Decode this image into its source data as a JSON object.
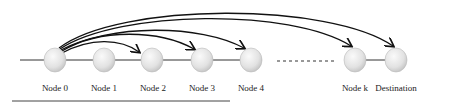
{
  "diagram": {
    "nodes": [
      {
        "id": "n0",
        "label": "Node 0"
      },
      {
        "id": "n1",
        "label": "Node 1"
      },
      {
        "id": "n2",
        "label": "Node 2"
      },
      {
        "id": "n3",
        "label": "Node 3"
      },
      {
        "id": "n4",
        "label": "Node 4"
      },
      {
        "id": "nk",
        "label": "Node k"
      },
      {
        "id": "dest",
        "label": "Destination"
      }
    ],
    "edges_from_node0": [
      "n2",
      "n3",
      "n4",
      "nk",
      "dest"
    ],
    "gap_indicator": "dashed ellipsis between Node 4 and Node k"
  }
}
